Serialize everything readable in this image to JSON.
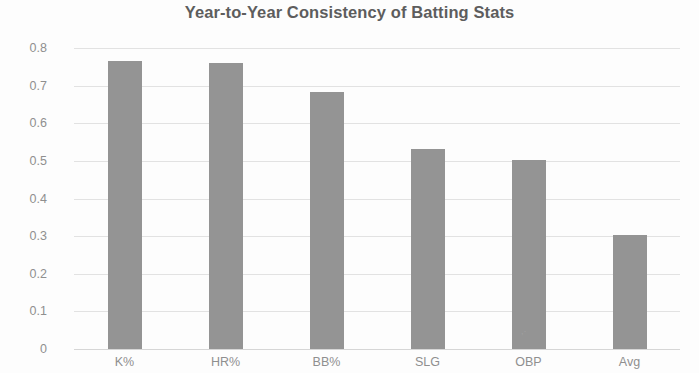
{
  "chart_data": {
    "type": "bar",
    "title": "Year-to-Year Consistency of Batting Stats",
    "xlabel": "",
    "ylabel": "",
    "categories": [
      "K%",
      "HR%",
      "BB%",
      "SLG",
      "OBP",
      "Avg"
    ],
    "values": [
      0.765,
      0.76,
      0.682,
      0.532,
      0.503,
      0.303
    ],
    "ylim": [
      0,
      0.8
    ],
    "yticks": [
      0,
      0.1,
      0.2,
      0.3,
      0.4,
      0.5,
      0.6,
      0.7,
      0.8
    ],
    "ytick_labels": [
      "0",
      "0.1",
      "0.2",
      "0.3",
      "0.4",
      "0.5",
      "0.6",
      "0.7",
      "0.8"
    ],
    "grid": true,
    "legend": false,
    "legend_position": "none",
    "series": [
      {
        "name": "Year-to-Year Consistency",
        "values": [
          0.765,
          0.76,
          0.682,
          0.532,
          0.503,
          0.303
        ]
      }
    ],
    "colors": {
      "bar": "#949494",
      "gridline": "#e2e2e2",
      "axis": "#d6d6d6",
      "title_text": "#5d5d5d",
      "tick_text": "#8f8f8f",
      "background": "#fdfdfd"
    },
    "annotations": []
  }
}
